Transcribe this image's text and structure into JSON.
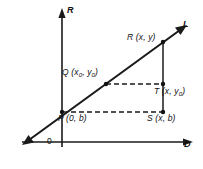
{
  "figure": {
    "kind": "coordinate-geometry-diagram",
    "background_color": "#ffffff",
    "stroke_color": "#1a1a1a",
    "axes": {
      "vertical_label": "R",
      "horizontal_label": "D",
      "origin_label": "0"
    },
    "line": {
      "label": "L",
      "arrowheads": "both"
    },
    "points": [
      {
        "id": "R",
        "label": "R (x, y)",
        "name": "R",
        "coords": "(x, y)"
      },
      {
        "id": "Q",
        "label": "Q (x₀, y₀)",
        "name": "Q",
        "coords": "(x₀, y₀)"
      },
      {
        "id": "T",
        "label": "T (x, y₀)",
        "name": "T",
        "coords": "(x, y₀)"
      },
      {
        "id": "P",
        "label": "P (0, b)",
        "name": "P",
        "coords": "(0, b)"
      },
      {
        "id": "S",
        "label": "S (x, b)",
        "name": "S",
        "coords": "(x, b)"
      }
    ],
    "labels": {
      "line_L": "L",
      "point_R": "R (x, y)",
      "point_Q_name": "Q (x",
      "point_Q_sub1": "0",
      "point_Q_mid": ", y",
      "point_Q_sub2": "0",
      "point_Q_end": ")",
      "point_T_name": "T (x, y",
      "point_T_sub": "0",
      "point_T_end": ")",
      "point_P": "P (0, b)",
      "point_S": "S (x, b)",
      "axis_R": "R",
      "axis_D": "D",
      "origin": "0",
      "point_R_name": "R (x, y)"
    }
  }
}
